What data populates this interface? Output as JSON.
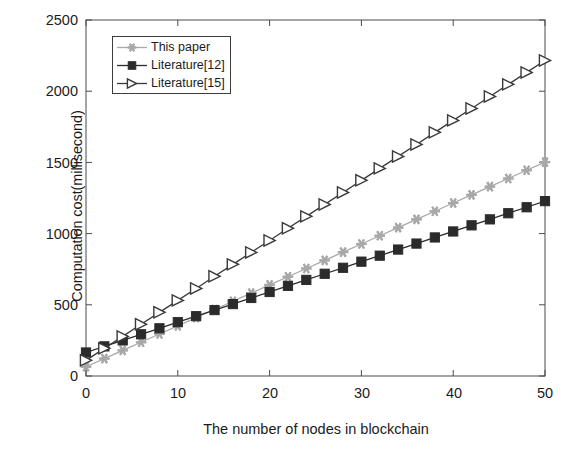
{
  "chart_data": {
    "type": "line",
    "title": "",
    "xlabel": "The number of nodes in blockchain",
    "ylabel": "Computation cost(millisecond)",
    "xlim": [
      0,
      50
    ],
    "ylim": [
      0,
      2500
    ],
    "xticks": [
      0,
      10,
      20,
      30,
      40,
      50
    ],
    "yticks": [
      0,
      500,
      1000,
      1500,
      2000,
      2500
    ],
    "grid": false,
    "legend_position": "upper left",
    "x": [
      0,
      2,
      4,
      6,
      8,
      10,
      12,
      14,
      16,
      18,
      20,
      22,
      24,
      26,
      28,
      30,
      32,
      34,
      36,
      38,
      40,
      42,
      44,
      46,
      48,
      50
    ],
    "series": [
      {
        "name": "This paper",
        "color": "#a8a8a8",
        "marker": "star",
        "values": [
          65,
          122,
          180,
          237,
          295,
          352,
          410,
          467,
          525,
          582,
          640,
          697,
          755,
          812,
          870,
          927,
          985,
          1042,
          1100,
          1157,
          1215,
          1272,
          1330,
          1387,
          1445,
          1502
        ]
      },
      {
        "name": "Literature[12]",
        "color": "#2b2b2b",
        "marker": "square",
        "values": [
          165,
          208,
          250,
          293,
          335,
          378,
          420,
          463,
          505,
          548,
          590,
          633,
          675,
          718,
          760,
          803,
          845,
          888,
          930,
          973,
          1015,
          1058,
          1100,
          1143,
          1185,
          1228
        ]
      },
      {
        "name": "Literature[15]",
        "color": "#3a3a3a",
        "marker": "triangle-right",
        "values": [
          110,
          194,
          278,
          363,
          447,
          531,
          615,
          700,
          784,
          868,
          952,
          1037,
          1121,
          1205,
          1289,
          1374,
          1458,
          1542,
          1626,
          1711,
          1795,
          1879,
          1963,
          2048,
          2132,
          2216
        ]
      }
    ]
  },
  "axes": {
    "ytick_labels": [
      "2500",
      "2000",
      "1500",
      "1000",
      "500",
      "0"
    ],
    "xtick_labels": [
      "0",
      "10",
      "20",
      "30",
      "40",
      "50"
    ]
  },
  "legend": {
    "items": [
      {
        "label": "This paper"
      },
      {
        "label": "Literature[12]"
      },
      {
        "label": "Literature[15]"
      }
    ]
  }
}
